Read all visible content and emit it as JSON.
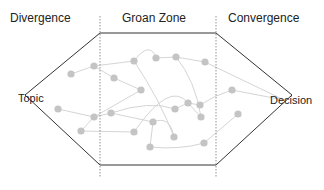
{
  "zones": [
    {
      "id": "divergence",
      "label": "Divergence"
    },
    {
      "id": "groan-zone",
      "label": "Groan Zone"
    },
    {
      "id": "convergence",
      "label": "Convergence"
    }
  ],
  "endpoints": {
    "start": "Topic",
    "end": "Decision"
  },
  "colors": {
    "outline": "#333333",
    "divider": "#777777",
    "node": "#c4c4c4",
    "edge": "#cfcfcf"
  }
}
